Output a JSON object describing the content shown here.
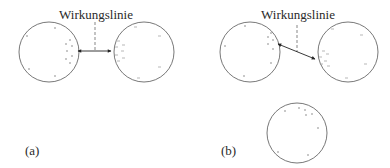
{
  "panels": [
    {
      "id": "a",
      "caption": "(a)",
      "label": "Wirkungslinie",
      "arrow_type": "horizontal"
    },
    {
      "id": "b",
      "caption": "(b)",
      "label": "Wirkungslinie",
      "arrow_type": "oblique"
    }
  ],
  "colors": {
    "stroke": "#444444",
    "text": "#2a2a2a",
    "background": "#ffffff"
  }
}
